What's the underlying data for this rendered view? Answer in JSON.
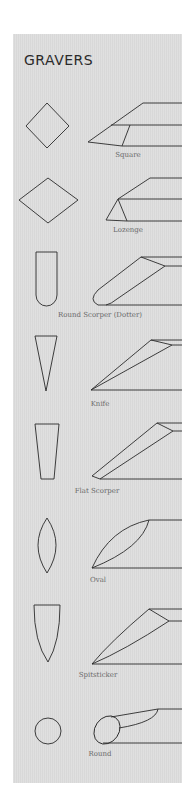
{
  "title": "GRAVERS",
  "colors": {
    "panel": "#dcdcdc",
    "line": "#2a2a2a",
    "label": "#6a6a6a"
  },
  "gravers": [
    {
      "name": "Square"
    },
    {
      "name": "Lozenge"
    },
    {
      "name": "Round Scorper (Dotter)"
    },
    {
      "name": "Knife"
    },
    {
      "name": "Flat Scorper"
    },
    {
      "name": "Oval"
    },
    {
      "name": "Spitsticker"
    },
    {
      "name": "Round"
    }
  ]
}
